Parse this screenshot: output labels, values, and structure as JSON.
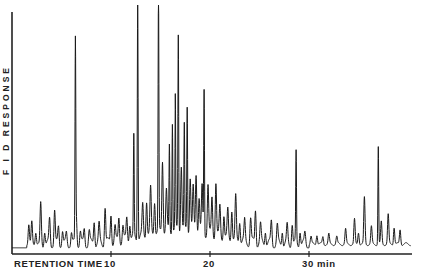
{
  "chart_data": {
    "type": "line",
    "title": "",
    "xlabel": "RETENTION TIME",
    "ylabel": "F I D RESPONSE",
    "x_unit": "min",
    "xlim": [
      0,
      40
    ],
    "ylim": [
      0,
      100
    ],
    "grid": false,
    "legend": null,
    "x_ticks": [
      10,
      20,
      30
    ],
    "x_tick_labels": [
      "10",
      "20",
      "30 min"
    ],
    "axis_label_text": "RETENTION TIME 10",
    "baseline_level": 2,
    "series": [
      {
        "name": "FID chromatogram",
        "peaks": [
          {
            "t": 1.7,
            "h": 8
          },
          {
            "t": 2.0,
            "h": 9
          },
          {
            "t": 2.4,
            "h": 5
          },
          {
            "t": 2.9,
            "h": 17
          },
          {
            "t": 3.3,
            "h": 6
          },
          {
            "t": 3.8,
            "h": 10
          },
          {
            "t": 4.3,
            "h": 14
          },
          {
            "t": 4.7,
            "h": 7
          },
          {
            "t": 5.1,
            "h": 6
          },
          {
            "t": 5.5,
            "h": 4
          },
          {
            "t": 6.0,
            "h": 5
          },
          {
            "t": 6.5,
            "h": 12
          },
          {
            "t": 6.9,
            "h": 5
          },
          {
            "t": 7.3,
            "h": 6
          },
          {
            "t": 7.8,
            "h": 5
          },
          {
            "t": 8.3,
            "h": 10
          },
          {
            "t": 8.8,
            "h": 7
          },
          {
            "t": 9.4,
            "h": 15
          },
          {
            "t": 10.0,
            "h": 12
          },
          {
            "t": 10.4,
            "h": 6
          },
          {
            "t": 10.8,
            "h": 10
          },
          {
            "t": 11.2,
            "h": 6
          },
          {
            "t": 6.4,
            "h": 81
          },
          {
            "t": 11.6,
            "h": 9
          },
          {
            "t": 11.9,
            "h": 7
          },
          {
            "t": 12.3,
            "h": 41
          },
          {
            "t": 12.7,
            "h": 100
          },
          {
            "t": 13.2,
            "h": 12
          },
          {
            "t": 13.6,
            "h": 15
          },
          {
            "t": 14.0,
            "h": 18
          },
          {
            "t": 14.4,
            "h": 14
          },
          {
            "t": 14.8,
            "h": 100
          },
          {
            "t": 15.2,
            "h": 30
          },
          {
            "t": 15.6,
            "h": 16
          },
          {
            "t": 15.9,
            "h": 35
          },
          {
            "t": 16.2,
            "h": 45
          },
          {
            "t": 16.5,
            "h": 54
          },
          {
            "t": 16.8,
            "h": 80
          },
          {
            "t": 17.1,
            "h": 27
          },
          {
            "t": 17.4,
            "h": 42
          },
          {
            "t": 17.7,
            "h": 51
          },
          {
            "t": 18.0,
            "h": 22
          },
          {
            "t": 18.3,
            "h": 17
          },
          {
            "t": 18.6,
            "h": 24
          },
          {
            "t": 18.9,
            "h": 14
          },
          {
            "t": 19.2,
            "h": 18
          },
          {
            "t": 19.4,
            "h": 59
          },
          {
            "t": 19.8,
            "h": 20
          },
          {
            "t": 20.2,
            "h": 15
          },
          {
            "t": 20.6,
            "h": 22
          },
          {
            "t": 21.0,
            "h": 12
          },
          {
            "t": 21.4,
            "h": 10
          },
          {
            "t": 21.8,
            "h": 11
          },
          {
            "t": 22.2,
            "h": 13
          },
          {
            "t": 22.6,
            "h": 17
          },
          {
            "t": 23.0,
            "h": 9
          },
          {
            "t": 23.5,
            "h": 8
          },
          {
            "t": 24.1,
            "h": 10
          },
          {
            "t": 24.6,
            "h": 14
          },
          {
            "t": 25.1,
            "h": 7
          },
          {
            "t": 25.6,
            "h": 6
          },
          {
            "t": 26.2,
            "h": 9
          },
          {
            "t": 26.8,
            "h": 7
          },
          {
            "t": 27.3,
            "h": 6
          },
          {
            "t": 27.8,
            "h": 7
          },
          {
            "t": 28.3,
            "h": 9
          },
          {
            "t": 28.7,
            "h": 37
          },
          {
            "t": 29.1,
            "h": 6
          },
          {
            "t": 29.6,
            "h": 4
          },
          {
            "t": 30.2,
            "h": 3
          },
          {
            "t": 30.8,
            "h": 4
          },
          {
            "t": 31.4,
            "h": 3
          },
          {
            "t": 32.0,
            "h": 4
          },
          {
            "t": 32.8,
            "h": 3
          },
          {
            "t": 33.7,
            "h": 6
          },
          {
            "t": 34.6,
            "h": 10
          },
          {
            "t": 35.0,
            "h": 5
          },
          {
            "t": 35.6,
            "h": 19
          },
          {
            "t": 36.3,
            "h": 7
          },
          {
            "t": 37.0,
            "h": 40
          },
          {
            "t": 37.3,
            "h": 9
          },
          {
            "t": 38.0,
            "h": 12
          },
          {
            "t": 38.6,
            "h": 7
          },
          {
            "t": 39.2,
            "h": 6
          }
        ]
      }
    ]
  }
}
